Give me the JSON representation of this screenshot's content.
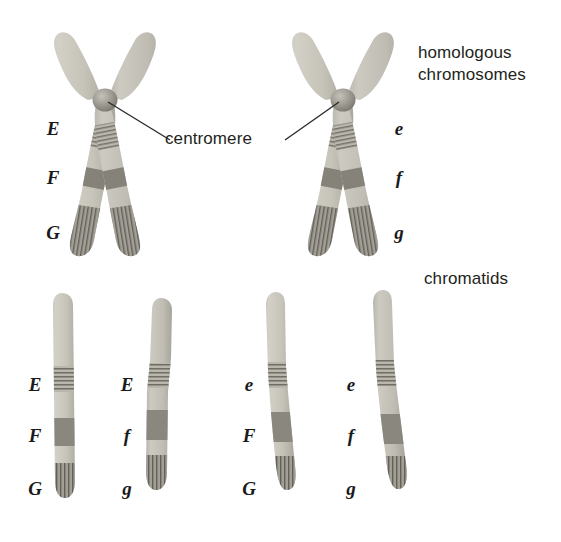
{
  "figure": {
    "background": "#ffffff"
  },
  "labels": {
    "homologous": "homologous\nchromosomes",
    "chromatids": "chromatids",
    "centromere": "centromere"
  },
  "colors": {
    "chromosome_light": "#c9c6bd",
    "chromosome_mid": "#b3b0a6",
    "chromosome_band_dark": "#8a877e",
    "chromosome_band_darker": "#6f6d66",
    "centromere_knob": "#9d9a92",
    "outline": "#8e8b83",
    "text": "#231f20",
    "allele_text": "#1a1a1a",
    "leader_line": "#2b2b2b"
  },
  "homologous_pair": [
    {
      "name": "maternal-chromosome",
      "side": "left",
      "alleles": [
        {
          "symbol": "E",
          "locus": "E",
          "x": 42,
          "y": 118
        },
        {
          "symbol": "F",
          "locus": "F",
          "x": 42,
          "y": 167
        },
        {
          "symbol": "G",
          "locus": "G",
          "x": 42,
          "y": 222
        }
      ]
    },
    {
      "name": "paternal-chromosome",
      "side": "right",
      "alleles": [
        {
          "symbol": "e",
          "locus": "E",
          "x": 388,
          "y": 118
        },
        {
          "symbol": "f",
          "locus": "F",
          "x": 388,
          "y": 167
        },
        {
          "symbol": "g",
          "locus": "G",
          "x": 388,
          "y": 222
        }
      ]
    }
  ],
  "chromatids": [
    {
      "name": "chromatid-1",
      "index": 1,
      "alleles": [
        {
          "symbol": "E",
          "locus": "E",
          "x": 24,
          "y": 374
        },
        {
          "symbol": "F",
          "locus": "F",
          "x": 24,
          "y": 425
        },
        {
          "symbol": "G",
          "locus": "G",
          "x": 24,
          "y": 478
        }
      ]
    },
    {
      "name": "chromatid-2",
      "index": 2,
      "alleles": [
        {
          "symbol": "E",
          "locus": "E",
          "x": 116,
          "y": 374
        },
        {
          "symbol": "f",
          "locus": "F",
          "x": 116,
          "y": 425
        },
        {
          "symbol": "g",
          "locus": "G",
          "x": 116,
          "y": 478
        }
      ]
    },
    {
      "name": "chromatid-3",
      "index": 3,
      "alleles": [
        {
          "symbol": "e",
          "locus": "E",
          "x": 238,
          "y": 374
        },
        {
          "symbol": "F",
          "locus": "F",
          "x": 238,
          "y": 425
        },
        {
          "symbol": "G",
          "locus": "G",
          "x": 238,
          "y": 478
        }
      ]
    },
    {
      "name": "chromatid-4",
      "index": 4,
      "alleles": [
        {
          "symbol": "e",
          "locus": "E",
          "x": 340,
          "y": 374
        },
        {
          "symbol": "f",
          "locus": "F",
          "x": 340,
          "y": 425
        },
        {
          "symbol": "g",
          "locus": "G",
          "x": 340,
          "y": 478
        }
      ]
    }
  ]
}
